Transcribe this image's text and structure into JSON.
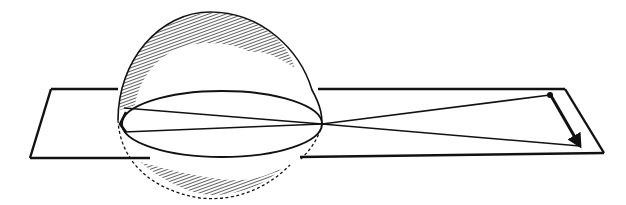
{
  "figure": {
    "type": "line-drawing",
    "colors": {
      "ink": "#111111",
      "background": "#ffffff"
    },
    "elements": {
      "plane": {
        "shape": "parallelogram"
      },
      "sphere": {
        "shading": "hatched-top-and-bottom"
      },
      "lens-ellipse": {
        "shape": "ellipse"
      },
      "rays": {
        "count": 4
      },
      "arrow": {
        "direction": "down-right"
      }
    }
  }
}
